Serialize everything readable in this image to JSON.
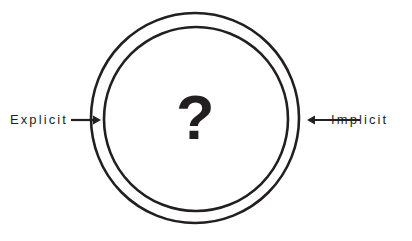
{
  "diagram": {
    "background_color": "#ffffff",
    "stroke_color": "#231f20",
    "center": {
      "symbol": "?",
      "icon_name": "question-mark-glyph"
    },
    "rings": [
      {
        "name": "outer-circle",
        "cx": 195,
        "cy": 118,
        "rx": 104,
        "ry": 105,
        "stroke_width": 2.6
      },
      {
        "name": "inner-circle",
        "cx": 196,
        "cy": 119,
        "rx": 92,
        "ry": 92,
        "stroke_width": 2.6
      }
    ],
    "annotations": [
      {
        "id": "explicit",
        "label": "Explicit",
        "side": "left",
        "arrow_direction": "right",
        "arrow_icon": "arrow-right-icon",
        "arrow_from_x": 71,
        "arrow_to_x": 101,
        "arrow_y": 120
      },
      {
        "id": "implicit",
        "label": "Implicit",
        "side": "right",
        "arrow_direction": "left",
        "arrow_icon": "arrow-left-icon",
        "arrow_from_x": 360,
        "arrow_to_x": 307,
        "arrow_y": 120
      }
    ]
  }
}
